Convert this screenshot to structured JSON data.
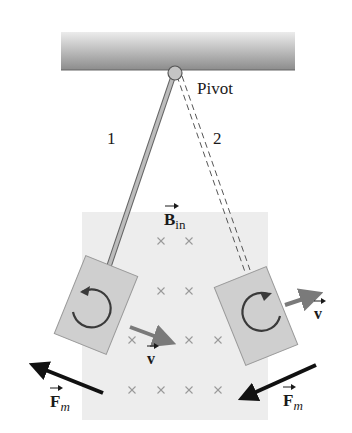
{
  "diagram": {
    "colors": {
      "ceiling_dark": "#8a8a8a",
      "ceiling_light": "#e0e0e0",
      "field_region": "#ececec",
      "plate": "#cfcfcf",
      "plate_border": "#9a9a9a",
      "rod": "#b5b5b5",
      "velocity_arrow": "#7a7a7a",
      "force_arrow": "#111111",
      "field_mark": "#9a9a9a"
    },
    "labels": {
      "pivot": "Pivot",
      "position_1": "1",
      "position_2": "2",
      "field_symbol": "B",
      "field_subscript": "in",
      "velocity_left": "v",
      "velocity_right": "v",
      "force_left": "F",
      "force_left_subscript": "m",
      "force_right": "F",
      "force_right_subscript": "m"
    },
    "positions": [
      {
        "id": "1",
        "style": "solid rod",
        "plate_side": "left",
        "eddy_current": "counterclockwise",
        "velocity": "down-right (toward field center)",
        "force": "up-left (opposes motion)"
      },
      {
        "id": "2",
        "style": "dashed rod",
        "plate_side": "right",
        "eddy_current": "clockwise",
        "velocity": "up-right (leaving field)",
        "force": "down-left (opposes motion)"
      }
    ],
    "field": {
      "direction": "into page",
      "marker": "×",
      "rows": [
        {
          "y": 241,
          "xs": [
            161,
            189
          ]
        },
        {
          "y": 291,
          "xs": [
            161,
            189
          ]
        },
        {
          "y": 340,
          "xs": [
            132,
            189,
            218
          ]
        },
        {
          "y": 390,
          "xs": [
            132,
            161,
            189,
            218
          ]
        }
      ]
    }
  }
}
